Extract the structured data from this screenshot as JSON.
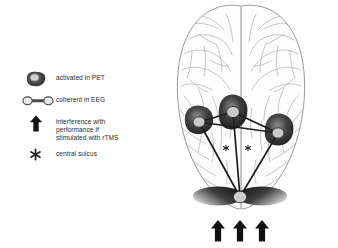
{
  "figure": {
    "type": "neuroanatomical-schematic",
    "view": "axial-superior-brain-with-network-overlay",
    "background_color": "#ffffff"
  },
  "legend": {
    "items": [
      {
        "id": "activated-in-pet",
        "icon": "filled-blob-icon",
        "label": "activated in PET",
        "color": "#3a3a3a"
      },
      {
        "id": "coherent-in-eeg",
        "icon": "dumbbell-link-icon",
        "label": "coherent in EEG",
        "color": "#4a4a4a"
      },
      {
        "id": "interference-rtms",
        "icon": "up-arrow-icon",
        "label": "interference with\nperformance if\nstimulated with rTMS",
        "color": "#1a1a1a"
      },
      {
        "id": "central-sulcus",
        "icon": "star-icon",
        "label": "central sulcus",
        "color": "#2a2a2a"
      }
    ]
  },
  "brain": {
    "outline_color": "#8a8a8a",
    "sulci_color": "#9a9a9a",
    "nodes": [
      {
        "id": "node-left-lateral",
        "label": "",
        "cx": 31,
        "cy": 122,
        "rx": 6.0,
        "ry": 5.2
      },
      {
        "id": "node-superior-medial",
        "label": "",
        "cx": 65,
        "cy": 112,
        "rx": 6.4,
        "ry": 5.6
      },
      {
        "id": "node-right-lateral",
        "label": "",
        "cx": 110,
        "cy": 133,
        "rx": 6.0,
        "ry": 5.2
      },
      {
        "id": "node-occipital",
        "label": "",
        "cx": 72,
        "cy": 197,
        "rx": 6.6,
        "ry": 5.8
      }
    ],
    "connections": [
      {
        "from": "node-left-lateral",
        "to": "node-superior-medial"
      },
      {
        "from": "node-superior-medial",
        "to": "node-right-lateral"
      },
      {
        "from": "node-left-lateral",
        "to": "node-right-lateral"
      },
      {
        "from": "node-left-lateral",
        "to": "node-occipital"
      },
      {
        "from": "node-superior-medial",
        "to": "node-occipital"
      },
      {
        "from": "node-right-lateral",
        "to": "node-occipital"
      }
    ],
    "central_sulcus_markers": [
      {
        "id": "star-left",
        "cx": 58,
        "cy": 148
      },
      {
        "id": "star-right",
        "cx": 80,
        "cy": 148
      }
    ],
    "rtms_arrows": [
      {
        "id": "arrow-1",
        "x": 50
      },
      {
        "id": "arrow-2",
        "x": 72
      },
      {
        "id": "arrow-3",
        "x": 94
      }
    ],
    "arrow_color": "#111111",
    "node_fill": "#c8c8c8",
    "node_stroke": "#2a2a2a",
    "activation_color": "#3a3a3a"
  }
}
